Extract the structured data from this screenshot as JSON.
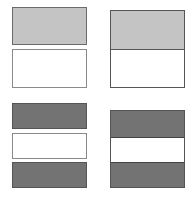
{
  "figure": {
    "colors": {
      "light_fill": "#c4c4c4",
      "dark_fill": "#737373",
      "white_fill": "#ffffff",
      "outline": "#555555"
    },
    "panels": [
      {
        "id": "top-left",
        "layout": "two separate boxes",
        "boxes": [
          "light",
          "white"
        ]
      },
      {
        "id": "top-right",
        "layout": "two joined bands",
        "boxes": [
          "light",
          "white"
        ]
      },
      {
        "id": "bottom-left",
        "layout": "three separate boxes",
        "boxes": [
          "dark",
          "white",
          "dark"
        ]
      },
      {
        "id": "bottom-right",
        "layout": "three joined bands",
        "boxes": [
          "dark",
          "white",
          "dark"
        ]
      }
    ]
  }
}
